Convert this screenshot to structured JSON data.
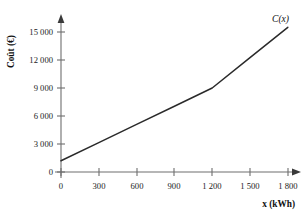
{
  "caption": {
    "text": "Coût en fonction de la consommation"
  },
  "chart_data": {
    "type": "line",
    "title": "",
    "subtitle": "",
    "xlabel": "x (kWh)",
    "ylabel": "Coût (€)",
    "series_label": "C(x)",
    "legend_position": "curve-end",
    "grid": false,
    "xlim": [
      0,
      1900
    ],
    "ylim": [
      0,
      16200
    ],
    "xticks": [
      0,
      300,
      600,
      900,
      1200,
      1500,
      1800
    ],
    "yticks": [
      0,
      3000,
      6000,
      9000,
      12000,
      15000
    ],
    "xtick_labels": [
      "0",
      "300",
      "600",
      "900",
      "1 200",
      "1 500",
      "1 800"
    ],
    "ytick_labels": [
      "0",
      "3 000",
      "6 000",
      "9 000",
      "12 000",
      "15 000"
    ],
    "x": [
      0,
      300,
      600,
      900,
      1200,
      1500,
      1800
    ],
    "values": [
      1200,
      3150,
      5100,
      7050,
      9000,
      12250,
      15500
    ],
    "series": [
      {
        "name": "C(x)",
        "x": [
          0,
          300,
          600,
          900,
          1200,
          1500,
          1800
        ],
        "values": [
          1200,
          3150,
          5100,
          7050,
          9000,
          12250,
          15500
        ]
      }
    ],
    "annotations": [
      {
        "label": "C(x)",
        "x": 1800,
        "y": 15500
      }
    ],
    "breakpoint": {
      "x": 1200,
      "y": 9000
    },
    "colors": {
      "curve": "#2a2a2a",
      "axis": "#6e6e6e",
      "text": "#111111",
      "background": "#ffffff"
    }
  },
  "axes_geometry": {
    "x_origin_px": 61,
    "y_origin_px": 172,
    "x_step_px": 37.8,
    "y_top_px": 32
  }
}
